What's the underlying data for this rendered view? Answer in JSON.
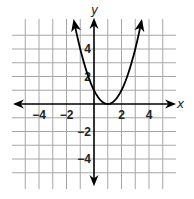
{
  "chart_data": {
    "type": "line",
    "title": "",
    "xlabel": "x",
    "ylabel": "y",
    "xlim": [
      -6,
      6
    ],
    "ylim": [
      -6.2,
      6
    ],
    "grid": true,
    "grid_step": 1,
    "x_ticks": [
      {
        "value": -4,
        "label": "−4"
      },
      {
        "value": -2,
        "label": "−2"
      },
      {
        "value": 2,
        "label": "2"
      },
      {
        "value": 4,
        "label": "4"
      }
    ],
    "y_ticks": [
      {
        "value": 4,
        "label": "4"
      },
      {
        "value": 2,
        "label": "2"
      },
      {
        "value": -2,
        "label": "−2"
      },
      {
        "value": -4,
        "label": "−4"
      }
    ],
    "series": [
      {
        "name": "parabola",
        "equation": "y = (x - 1)^2",
        "vertex": [
          1,
          0
        ],
        "x_range": [
          -1.45,
          3.45
        ],
        "arrows": "both-ends",
        "color": "#000000"
      }
    ]
  }
}
